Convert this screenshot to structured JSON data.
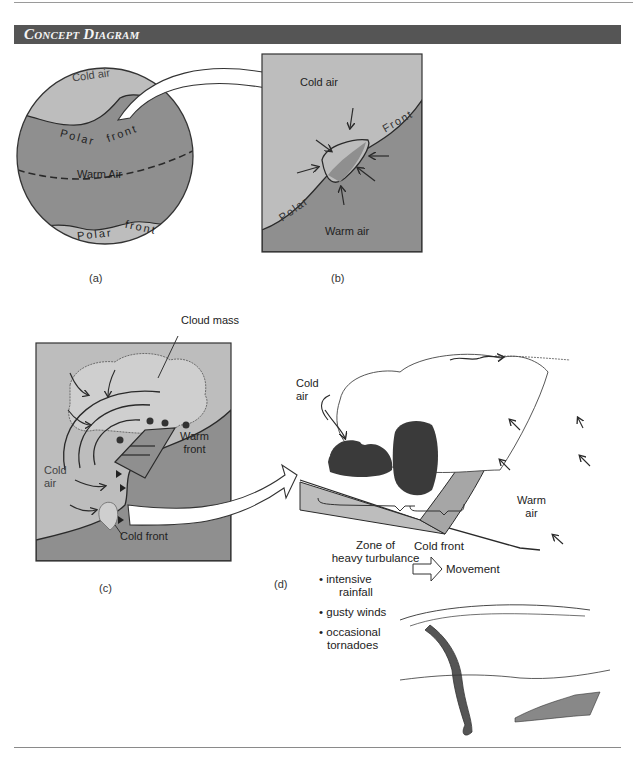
{
  "header": {
    "title": "Concept Diagram"
  },
  "panels": {
    "a": {
      "letter": "(a)",
      "labels": {
        "cold_air": "Cold air",
        "polar_front_top_1": "Polar",
        "polar_front_top_2": "front",
        "warm_air": "Warm Air",
        "polar_front_bottom_1": "Polar",
        "polar_front_bottom_2": "front"
      }
    },
    "b": {
      "letter": "(b)",
      "labels": {
        "cold_air": "Cold air",
        "front": "Front",
        "polar": "Polar",
        "warm_air": "Warm air"
      }
    },
    "c": {
      "letter": "(c)",
      "labels": {
        "cloud_mass": "Cloud mass",
        "warm_front_1": "Warm",
        "warm_front_2": "front",
        "cold_air_1": "Cold",
        "cold_air_2": "air",
        "cold_front": "Cold front"
      }
    },
    "d": {
      "letter": "(d)",
      "labels": {
        "cold_air_1": "Cold",
        "cold_air_2": "air",
        "warm_air_1": "Warm",
        "warm_air_2": "air",
        "zone_1": "Zone of",
        "zone_2": "heavy turbulance",
        "cold_front": "Cold front",
        "movement": "Movement"
      },
      "bullets": [
        "intensive",
        "rainfall",
        "gusty winds",
        "occasional",
        "tornadoes"
      ]
    }
  },
  "colors": {
    "header_bg": "#555555",
    "cold_air": "#bdbdbd",
    "warm_air": "#8f8f8f",
    "dark_cloud": "#3a3a3a",
    "line": "#2a2a2a"
  }
}
